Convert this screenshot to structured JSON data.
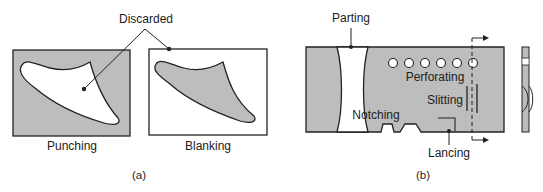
{
  "figure_a": {
    "caption": "(a)",
    "callout": "Discarded",
    "panels": [
      {
        "label": "Punching"
      },
      {
        "label": "Blanking"
      }
    ]
  },
  "figure_b": {
    "caption": "(b)",
    "labels": {
      "parting": "Parting",
      "perforating": "Perforating",
      "slitting": "Slitting",
      "notching": "Notching",
      "lancing": "Lancing"
    },
    "hole_count": 6
  },
  "colors": {
    "sheet_gray": "#bdbdbd",
    "outline": "#222222",
    "background": "#ffffff"
  }
}
